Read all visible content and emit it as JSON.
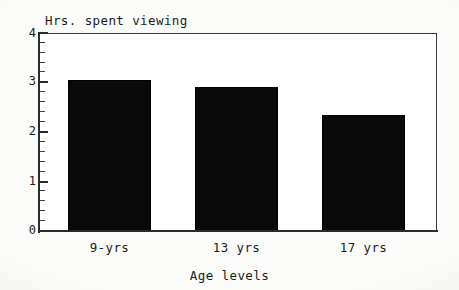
{
  "chart_data": {
    "type": "bar",
    "title": "",
    "categories": [
      "9-yrs",
      "13 yrs",
      "17 yrs"
    ],
    "values": [
      3.05,
      2.9,
      2.35
    ],
    "xlabel": "Age levels",
    "ylabel": "Hrs. spent viewing",
    "ylim": [
      0,
      4
    ],
    "xlim_note": "categorical",
    "y_major_ticks": [
      "0",
      "1",
      "2",
      "3",
      "4"
    ],
    "y_minor_ticks_per_interval": 4,
    "grid": false,
    "legend": null,
    "bar_color": "#0a0a0a",
    "frame_color": "#2b2b2b",
    "background": "#fbfbf9"
  },
  "axes": {
    "y_title": "Hrs. spent viewing",
    "x_title": "Age levels",
    "y_labels": [
      {
        "text": "4",
        "value": 4
      },
      {
        "text": "3",
        "value": 3
      },
      {
        "text": "2",
        "value": 2
      },
      {
        "text": "1",
        "value": 1
      },
      {
        "text": "0",
        "value": 0
      }
    ],
    "x_labels": [
      {
        "text": "9-yrs"
      },
      {
        "text": "13 yrs"
      },
      {
        "text": "17 yrs"
      }
    ]
  }
}
